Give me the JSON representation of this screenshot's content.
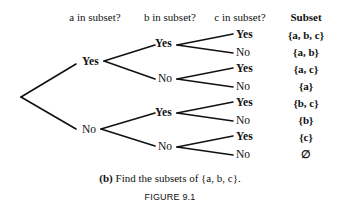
{
  "headers": {
    "a": "a in subset?",
    "b": "b in subset?",
    "c": "c in subset?",
    "subset": "Subset"
  },
  "tree": {
    "level1": [
      {
        "label": "Yes",
        "bold": true
      },
      {
        "label": "No",
        "bold": false
      }
    ],
    "level2": [
      {
        "label": "Yes",
        "bold": true
      },
      {
        "label": "No",
        "bold": false
      },
      {
        "label": "Yes",
        "bold": true
      },
      {
        "label": "No",
        "bold": false
      }
    ],
    "level3": [
      {
        "label": "Yes",
        "bold": true
      },
      {
        "label": "No",
        "bold": false
      },
      {
        "label": "Yes",
        "bold": true
      },
      {
        "label": "No",
        "bold": false
      },
      {
        "label": "Yes",
        "bold": true
      },
      {
        "label": "No",
        "bold": false
      },
      {
        "label": "Yes",
        "bold": true
      },
      {
        "label": "No",
        "bold": false
      }
    ]
  },
  "subsets": [
    "{a, b, c}",
    "{a, b}",
    "{a, c}",
    "{a}",
    "{b, c}",
    "{b}",
    "{c}",
    "∅"
  ],
  "caption": {
    "prefix": "(b)",
    "text": " Find the subsets of {a, b, c}."
  },
  "figure_label": "FIGURE 9.1"
}
